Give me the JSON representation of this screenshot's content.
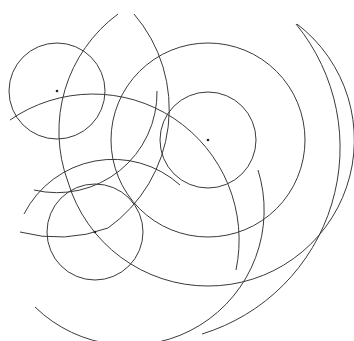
{
  "figure": {
    "width": 354,
    "height": 341,
    "background": "#ffffff",
    "stroke_color": "#3a3a3a",
    "centers": [
      {
        "name": "A",
        "x": 57,
        "y": 91
      },
      {
        "name": "B",
        "x": 208,
        "y": 140
      },
      {
        "name": "C",
        "x": 95,
        "y": 232
      }
    ],
    "circles": [
      {
        "center": "A",
        "r": 48
      },
      {
        "center": "B",
        "r": 48
      },
      {
        "center": "C",
        "r": 48
      },
      {
        "center": "B",
        "r": 96
      }
    ],
    "arcs": [
      {
        "center": "B",
        "r": 146,
        "note": "large outer arc around B"
      },
      {
        "center": "C",
        "r": 146,
        "note": "arc through A and B"
      },
      {
        "center": "A",
        "r": 146,
        "note": "arc through C"
      },
      {
        "center": "A",
        "r": 100
      },
      {
        "center": "C",
        "r": 100
      },
      {
        "center": "B",
        "r": 195,
        "note": "outermost right arc"
      }
    ]
  }
}
